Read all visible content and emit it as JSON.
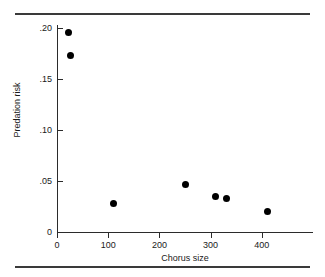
{
  "figure": {
    "top_rule": "",
    "bottom_rule": ""
  },
  "chart_data": {
    "type": "scatter",
    "title": "",
    "xlabel": "Chorus size",
    "ylabel": "Predation risk",
    "xlim": [
      0,
      500
    ],
    "ylim": [
      0,
      0.2
    ],
    "grid": false,
    "legend": null,
    "xticks": [
      0,
      100,
      200,
      300,
      400
    ],
    "xtick_labels": [
      "0",
      "100",
      "200",
      "300",
      "400"
    ],
    "yticks": [
      0,
      0.05,
      0.1,
      0.15,
      0.2
    ],
    "ytick_labels": [
      "0",
      ".05",
      ".10",
      ".15",
      ".20"
    ],
    "points": [
      {
        "x": 22,
        "y": 0.196
      },
      {
        "x": 27,
        "y": 0.173
      },
      {
        "x": 110,
        "y": 0.028
      },
      {
        "x": 251,
        "y": 0.047
      },
      {
        "x": 310,
        "y": 0.035
      },
      {
        "x": 331,
        "y": 0.033
      },
      {
        "x": 412,
        "y": 0.02
      }
    ],
    "marker": "filled-circle",
    "marker_color": "#000000"
  }
}
